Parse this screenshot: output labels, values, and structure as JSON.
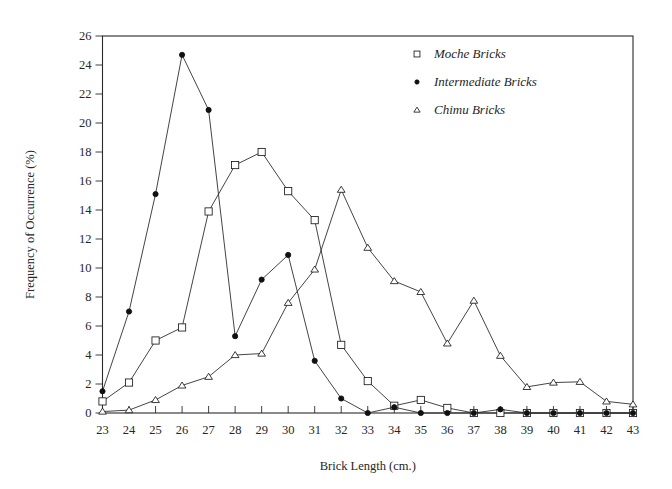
{
  "chart_data": {
    "type": "line",
    "title": "",
    "xlabel": "Brick Length (cm.)",
    "ylabel": "Frequency of Occurrence (%)",
    "x": [
      23,
      24,
      25,
      26,
      27,
      28,
      29,
      30,
      31,
      32,
      33,
      34,
      35,
      36,
      37,
      38,
      39,
      40,
      41,
      42,
      43
    ],
    "xlim": [
      23,
      43
    ],
    "ylim": [
      0,
      26
    ],
    "xticks": [
      "23",
      "24",
      "25",
      "26",
      "27",
      "28",
      "29",
      "30",
      "31",
      "32",
      "33",
      "34",
      "35",
      "36",
      "37",
      "38",
      "39",
      "40",
      "41",
      "42",
      "43"
    ],
    "yticks": [
      "0",
      "2",
      "4",
      "6",
      "8",
      "10",
      "12",
      "14",
      "16",
      "18",
      "20",
      "22",
      "24",
      "26"
    ],
    "grid": false,
    "legend_position": "top-right",
    "series": [
      {
        "name": "Moche Bricks",
        "marker": "open-square",
        "values": [
          0.8,
          2.1,
          5.0,
          5.9,
          13.9,
          17.1,
          18.0,
          15.3,
          13.3,
          4.7,
          2.2,
          0.5,
          0.9,
          0.35,
          0.0,
          0.0,
          0.0,
          0.0,
          0.0,
          0.0,
          0.0
        ]
      },
      {
        "name": "Intermediate Bricks",
        "marker": "filled-circle",
        "values": [
          1.5,
          7.0,
          15.1,
          24.7,
          20.9,
          5.3,
          9.2,
          10.9,
          3.6,
          1.0,
          0.0,
          0.4,
          0.0,
          0.0,
          0.0,
          0.25,
          0.0,
          0.0,
          0.0,
          0.0,
          0.0
        ]
      },
      {
        "name": "Chimu Bricks",
        "marker": "open-triangle",
        "values": [
          0.1,
          0.2,
          0.9,
          1.9,
          2.5,
          4.0,
          4.1,
          7.6,
          9.9,
          15.4,
          11.4,
          9.1,
          8.35,
          4.8,
          7.75,
          3.95,
          1.8,
          2.1,
          2.15,
          0.8,
          0.6
        ]
      }
    ]
  },
  "legend": {
    "entries": [
      {
        "label": "Moche Bricks",
        "marker": "open-square-icon"
      },
      {
        "label": "Intermediate Bricks",
        "marker": "filled-circle-icon"
      },
      {
        "label": "Chimu Bricks",
        "marker": "open-triangle-icon"
      }
    ]
  }
}
